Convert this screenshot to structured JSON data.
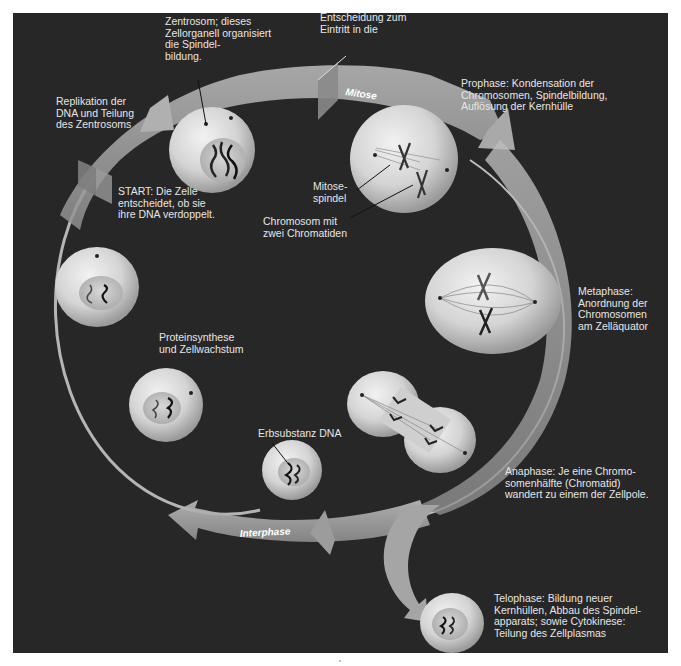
{
  "figure": {
    "background_color": "#272727",
    "text_color": "#e6e6e6",
    "arrow_color": "#a8a8a8",
    "cell_color": "#d0d0d0",
    "cycle_arrows": {
      "mitosis": "Mitose",
      "interphase": "Interphase"
    },
    "labels": {
      "centrosome": "Zentrosom; dieses\nZellorganell organisiert\ndie Spindel-\nbildung.",
      "mitosis_entry": "Entscheidung zum\nEintritt in die",
      "replication": "Replikation der\nDNA und Teilung\ndes Zentrosoms",
      "prophase": "Prophase: Kondensation der\nChromosomen, Spindelbildung,\nAuflösung der Kernhülle",
      "start": "START: Die Zelle\nentscheidet, ob sie\nihre DNA verdoppelt.",
      "spindle": "Mitose-\nspindel",
      "chromosome": "Chromosom mit\nzwei Chromatiden",
      "metaphase": "Metaphase:\nAnordnung der\nChromosomen\nam Zelläquator",
      "protein_synthesis": "Proteinsynthese\nund Zellwachstum",
      "dna": "Erbsubstanz DNA",
      "anaphase": "Anaphase: Je eine Chromo-\nsomenhälfte (Chromatid)\nwandert zu einem der Zellpole.",
      "telophase": "Telophase: Bildung neuer\nKernhüllen, Abbau des Spindel-\napparats; sowie Cytokinese:\nTeilung des Zellplasmas"
    }
  }
}
